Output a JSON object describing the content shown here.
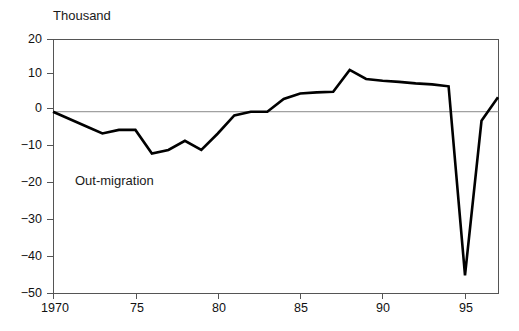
{
  "chart_data": {
    "type": "line",
    "title": "",
    "subtitle": "",
    "unit_label": "Thousand",
    "xlabel": "",
    "ylabel": "",
    "annotations": [
      {
        "text": "Out-migration",
        "x": 1974.5,
        "y": -20
      }
    ],
    "grid": false,
    "legend": "none",
    "zero_line": true,
    "xlim": [
      1970,
      1997
    ],
    "ylim": [
      -50,
      20
    ],
    "yticks": [
      20,
      10,
      0,
      -10,
      -20,
      -30,
      -40,
      -50
    ],
    "ytick_labels": [
      "20",
      "10",
      "0",
      "−10",
      "−20",
      "−30",
      "−40",
      "−50"
    ],
    "xticks": [
      1970,
      1975,
      1980,
      1985,
      1990,
      1995
    ],
    "xtick_labels": [
      "1970",
      "75",
      "80",
      "85",
      "90",
      "95"
    ],
    "series": [
      {
        "name": "Net migration",
        "color": "#000000",
        "x": [
          1970,
          1971,
          1972,
          1973,
          1974,
          1975,
          1976,
          1977,
          1978,
          1979,
          1980,
          1981,
          1982,
          1983,
          1984,
          1985,
          1986,
          1987,
          1988,
          1989,
          1990,
          1991,
          1992,
          1993,
          1994,
          1995,
          1996,
          1997
        ],
        "values": [
          0,
          -2,
          -4,
          -6,
          -5,
          -5,
          -11.5,
          -10.5,
          -8,
          -10.5,
          -6,
          -1,
          0,
          0,
          3.5,
          5,
          5.3,
          5.5,
          11.5,
          9,
          8.5,
          8.2,
          7.8,
          7.5,
          7,
          -45,
          -2.5,
          4
        ]
      }
    ]
  },
  "colors": {
    "line": "#000000",
    "axis": "#555555",
    "zero_line": "#888888",
    "text": "#111111",
    "background": "#ffffff"
  }
}
